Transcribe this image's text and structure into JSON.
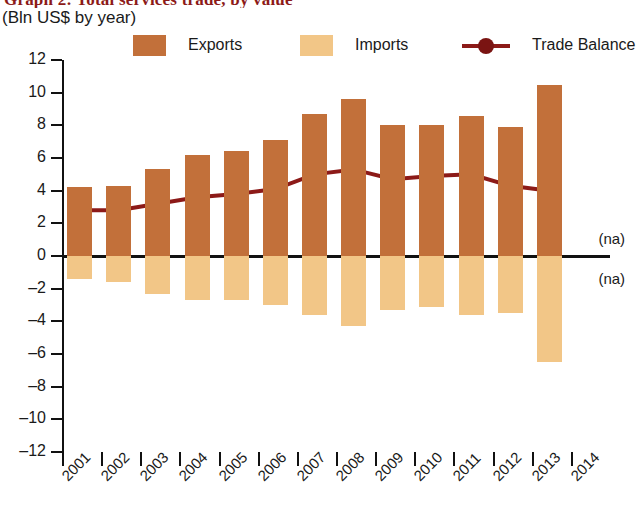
{
  "header": {
    "title": "Graph 2: Total services trade, by value",
    "subtitle": "(Bln US$ by year)"
  },
  "legend": {
    "items": [
      {
        "label": "Exports",
        "color": "#C2703A",
        "marker": "square"
      },
      {
        "label": "Imports",
        "color": "#F2C687",
        "marker": "square"
      },
      {
        "label": "Trade Balance",
        "color": "#8C1A18",
        "marker": "line-dot"
      }
    ]
  },
  "annotations": [
    {
      "text": "(na)",
      "year": "2014",
      "side": "above-zero"
    },
    {
      "text": "(na)",
      "year": "2014",
      "side": "below-zero"
    }
  ],
  "chart_data": {
    "type": "bar",
    "title": "Graph 2: Total services trade, by value",
    "subtitle": "(Bln US$ by year)",
    "xlabel": "",
    "ylabel": "",
    "ylim": [
      -12,
      12
    ],
    "ytick_step": 2,
    "yticks": [
      12,
      10,
      8,
      6,
      4,
      2,
      0,
      -2,
      -4,
      -6,
      -8,
      -10,
      -12
    ],
    "grid": false,
    "legend_position": "top",
    "categories": [
      "2001",
      "2002",
      "2003",
      "2004",
      "2005",
      "2006",
      "2007",
      "2008",
      "2009",
      "2010",
      "2011",
      "2012",
      "2013",
      "2014"
    ],
    "series": [
      {
        "name": "Exports",
        "type": "bar",
        "color": "#C2703A",
        "values": [
          4.2,
          4.3,
          5.3,
          6.2,
          6.4,
          7.1,
          8.7,
          9.6,
          8.0,
          8.0,
          8.6,
          7.9,
          10.5,
          null
        ]
      },
      {
        "name": "Imports",
        "type": "bar",
        "color": "#F2C687",
        "values": [
          -1.4,
          -1.6,
          -2.3,
          -2.7,
          -2.7,
          -3.0,
          -3.6,
          -4.3,
          -3.3,
          -3.1,
          -3.6,
          -3.5,
          -6.5,
          null
        ]
      },
      {
        "name": "Trade Balance",
        "type": "line",
        "color": "#8C1A18",
        "values": [
          2.8,
          2.8,
          3.2,
          3.6,
          3.8,
          4.1,
          5.0,
          5.3,
          4.7,
          4.9,
          5.0,
          4.3,
          4.0,
          null
        ]
      }
    ]
  }
}
